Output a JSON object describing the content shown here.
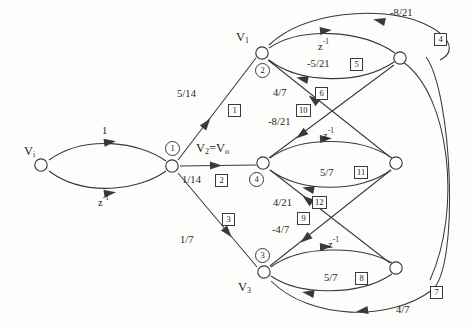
{
  "figure": {
    "type": "signal-flow-graph",
    "title": "",
    "background_color": "#fdfdfb",
    "line_color": "#39393c"
  },
  "nodes": [
    {
      "id": "vi",
      "label": "V",
      "sublabel": "i",
      "index": "",
      "x": 41,
      "y": 165,
      "label_pos": "left-above"
    },
    {
      "id": "n1",
      "label": "",
      "sublabel": "",
      "index": "1",
      "x": 172,
      "y": 166,
      "label_pos": "above"
    },
    {
      "id": "v1",
      "label": "V",
      "sublabel": "1",
      "index": "2",
      "x": 262,
      "y": 53,
      "label_pos": "left"
    },
    {
      "id": "v2",
      "label": "V",
      "sublabel": "2",
      "index": "4",
      "x": 263,
      "y": 163,
      "label_pos": "above-left"
    },
    {
      "id": "v3",
      "label": "V",
      "sublabel": "3",
      "index": "3",
      "x": 264,
      "y": 272,
      "label_pos": "below-left"
    },
    {
      "id": "r1",
      "label": "",
      "sublabel": "",
      "index": "",
      "x": 400,
      "y": 58,
      "label_pos": ""
    },
    {
      "id": "r2",
      "label": "",
      "sublabel": "",
      "index": "",
      "x": 396,
      "y": 163,
      "label_pos": ""
    },
    {
      "id": "r3",
      "label": "",
      "sublabel": "",
      "index": "",
      "x": 396,
      "y": 268,
      "label_pos": ""
    }
  ],
  "node_labels": {
    "vi": "V",
    "vi_sub": "i",
    "v1": "V",
    "v1_sub": "1",
    "v2": "V",
    "v2_sub": "2",
    "v2_eq": "=V",
    "v2_out_sub": "o",
    "v3": "V",
    "v3_sub": "3"
  },
  "node_indices": [
    {
      "id": "idx-1",
      "text": "1"
    },
    {
      "id": "idx-2",
      "text": "2"
    },
    {
      "id": "idx-3",
      "text": "3"
    },
    {
      "id": "idx-4",
      "text": "4"
    }
  ],
  "edges": [
    {
      "id": "e-vi-n1-top",
      "from": "vi",
      "to": "n1",
      "gain": "1",
      "gain_sup": "",
      "branch": "",
      "desc": "Vi to node1 upper arc"
    },
    {
      "id": "e-vi-n1-bot",
      "from": "vi",
      "to": "n1",
      "gain": "z",
      "gain_sup": "-1",
      "branch": "",
      "desc": "Vi to node1 lower arc"
    },
    {
      "id": "e-n1-v1",
      "from": "n1",
      "to": "v1",
      "gain": "5/14",
      "gain_sup": "",
      "branch": "1",
      "desc": "node1 to V1"
    },
    {
      "id": "e-n1-v2",
      "from": "n1",
      "to": "v2",
      "gain": "1/14",
      "gain_sup": "",
      "branch": "2",
      "desc": "node1 to V2"
    },
    {
      "id": "e-n1-v3",
      "from": "n1",
      "to": "v3",
      "gain": "1/7",
      "gain_sup": "",
      "branch": "3",
      "desc": "node1 to V3"
    },
    {
      "id": "e-v1-r1-top",
      "from": "v1",
      "to": "r1",
      "gain": "z",
      "gain_sup": "-1",
      "branch": "",
      "desc": "V1 to right1 upper arc"
    },
    {
      "id": "e-r1-v1-bot",
      "from": "r1",
      "to": "v1",
      "gain": "-5/21",
      "gain_sup": "",
      "branch": "5",
      "desc": "right1 back to V1 lower arc"
    },
    {
      "id": "e-r1-v1-outer",
      "from": "r1",
      "to": "v1",
      "gain": "-8/21",
      "gain_sup": "",
      "branch": "4",
      "desc": "outer return into V1 top"
    },
    {
      "id": "e-r2-v1",
      "from": "r2",
      "to": "v1",
      "gain": "4/7",
      "gain_sup": "",
      "branch": "6",
      "desc": "right2 to V1 diagonal"
    },
    {
      "id": "e-r1-v2",
      "from": "r1",
      "to": "v2",
      "gain": "-8/21",
      "gain_sup": "",
      "branch": "10",
      "desc": "right1 to V2 diagonal"
    },
    {
      "id": "e-v2-r2-top",
      "from": "v2",
      "to": "r2",
      "gain": "z",
      "gain_sup": "-1",
      "branch": "",
      "desc": "V2 to right2 upper arc"
    },
    {
      "id": "e-r2-v2-bot",
      "from": "r2",
      "to": "v2",
      "gain": "5/7",
      "gain_sup": "",
      "branch": "11",
      "desc": "right2 back to V2 lower arc"
    },
    {
      "id": "e-r3-v2",
      "from": "r3",
      "to": "v2",
      "gain": "4/21",
      "gain_sup": "",
      "branch": "12",
      "desc": "right3 to V2 diagonal"
    },
    {
      "id": "e-r2-v3",
      "from": "r2",
      "to": "v3",
      "gain": "-4/7",
      "gain_sup": "",
      "branch": "9",
      "desc": "right2 to V3 diagonal"
    },
    {
      "id": "e-v3-r3-top",
      "from": "v3",
      "to": "r3",
      "gain": "z",
      "gain_sup": "-1",
      "branch": "",
      "desc": "V3 to right3 upper arc"
    },
    {
      "id": "e-r3-v3-bot",
      "from": "r3",
      "to": "v3",
      "gain": "5/7",
      "gain_sup": "",
      "branch": "8",
      "desc": "right3 back to V3 lower arc"
    },
    {
      "id": "e-r1-v3-outer",
      "from": "r1",
      "to": "v3",
      "gain": "4/7",
      "gain_sup": "",
      "branch": "7",
      "desc": "outer return into V3 bottom"
    }
  ],
  "gain_labels": {
    "g_one": "1",
    "g_zinv": "z",
    "zinv_sup": "-1",
    "g_5_14": "5/14",
    "g_1_14": "1/14",
    "g_1_7": "1/7",
    "g_4_7": "4/7",
    "g_neg_5_21": "-5/21",
    "g_neg_8_21_top": "-8/21",
    "g_neg_8_21_mid": "-8/21",
    "g_5_7_mid": "5/7",
    "g_4_21": "4/21",
    "g_neg_4_7": "-4/7",
    "g_5_7_bot": "5/7",
    "g_4_7_bot": "4/7"
  },
  "branch_numbers": [
    {
      "id": "b1",
      "text": "1"
    },
    {
      "id": "b2",
      "text": "2"
    },
    {
      "id": "b3",
      "text": "3"
    },
    {
      "id": "b4",
      "text": "4"
    },
    {
      "id": "b5",
      "text": "5"
    },
    {
      "id": "b6",
      "text": "6"
    },
    {
      "id": "b7",
      "text": "7"
    },
    {
      "id": "b8",
      "text": "8"
    },
    {
      "id": "b9",
      "text": "9"
    },
    {
      "id": "b10",
      "text": "10"
    },
    {
      "id": "b11",
      "text": "11"
    },
    {
      "id": "b12",
      "text": "12"
    }
  ]
}
